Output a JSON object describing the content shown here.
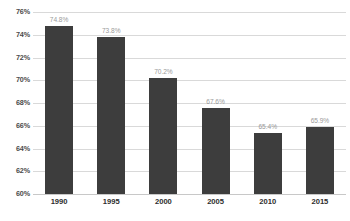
{
  "chart_data": {
    "type": "bar",
    "title": "",
    "subtitle": "",
    "xlabel": "",
    "ylabel": "",
    "categories": [
      "1990",
      "1995",
      "2000",
      "2005",
      "2010",
      "2015"
    ],
    "values": [
      74.8,
      73.8,
      70.2,
      67.6,
      65.4,
      65.9
    ],
    "value_labels": [
      "74.8%",
      "73.8%",
      "70.2%",
      "67.6%",
      "65.4%",
      "65.9%"
    ],
    "ylim": [
      60,
      76
    ],
    "ytick_values": [
      60,
      62,
      64,
      66,
      68,
      70,
      72,
      74,
      76
    ],
    "ytick_labels": [
      "60%",
      "62%",
      "64%",
      "66%",
      "68%",
      "70%",
      "72%",
      "74%",
      "76%"
    ],
    "grid": true,
    "legend": null,
    "legend_position": "none",
    "bar_baseline": 60,
    "colors": {
      "bar": "#3d3d3d",
      "gridline": "#d9d9d9",
      "axis": "#c8c8c8",
      "value_label": "#9a9a9a",
      "ytick_label": "#4a4a4a",
      "xtick_label": "#2d2d2d",
      "background": "#ffffff"
    }
  }
}
